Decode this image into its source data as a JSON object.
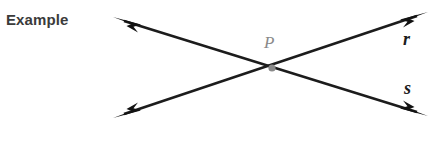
{
  "figure": {
    "title": "Example",
    "background_color": "#ffffff",
    "line_color": "#1c1c1c",
    "point_color": "#8a8a8a",
    "label_color": "#3b3b3b",
    "labels": {
      "line_r": "r",
      "line_s": "s",
      "point_p": "P"
    },
    "geometry": {
      "intersection_point": {
        "x": 272,
        "y": 68
      },
      "lines": [
        {
          "name": "r",
          "from": {
            "x": 113,
            "y": 118
          },
          "to": {
            "x": 428,
            "y": 12
          },
          "arrowheads": "both",
          "label_position": {
            "x": 403,
            "y": 29
          }
        },
        {
          "name": "s",
          "from": {
            "x": 113,
            "y": 17
          },
          "to": {
            "x": 428,
            "y": 116
          },
          "arrowheads": "both",
          "label_position": {
            "x": 404,
            "y": 78
          }
        }
      ],
      "point_marker": {
        "shape": "dot",
        "size": 7,
        "x": 272,
        "y": 68
      }
    }
  }
}
